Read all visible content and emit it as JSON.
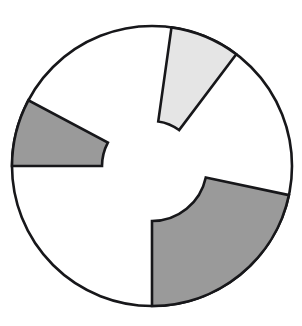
{
  "figure": {
    "title": "",
    "background_color": "#ffffff",
    "outline_color": "#17171a",
    "outline_width": 2.6
  },
  "chart_data": {
    "type": "pie",
    "title": "",
    "subtitle": "",
    "xlabel": "",
    "ylabel": "",
    "grid": false,
    "legend_position": "none",
    "center": {
      "x": 152,
      "y": 166
    },
    "radius": 140,
    "note": "Exploded/annular pie: highlighted wedges are drawn as annular segments that do not reach the centre; remaining area is an unbroken white disc.",
    "categories": [
      "Segment A",
      "Segment B",
      "Segment C",
      "Remainder"
    ],
    "values": [
      8,
      8,
      22,
      62
    ],
    "colors": [
      "#e5e5e5",
      "#9a9a9a",
      "#9a9a9a",
      "#ffffff"
    ],
    "slices": [
      {
        "name": "Segment A",
        "label": "light-gray-wedge",
        "fill": "#e5e5e5",
        "start_angle_deg": 53,
        "end_angle_deg": 82,
        "sweep_deg": 29,
        "percent": 8,
        "inner_radius": 45,
        "outer_radius": 140
      },
      {
        "name": "Segment B",
        "label": "upper-left-dark-wedge",
        "fill": "#9a9a9a",
        "start_angle_deg": 152,
        "end_angle_deg": 180,
        "sweep_deg": 28,
        "percent": 8,
        "inner_radius": 50,
        "outer_radius": 140
      },
      {
        "name": "Segment C",
        "label": "lower-right-dark-wedge",
        "fill": "#9a9a9a",
        "start_angle_deg": 270,
        "end_angle_deg": 348,
        "sweep_deg": 78,
        "percent": 22,
        "inner_radius": 55,
        "outer_radius": 140
      },
      {
        "name": "Remainder",
        "label": "white-remainder",
        "fill": "#ffffff",
        "start_angle_deg": 0,
        "end_angle_deg": 360,
        "sweep_deg": 225,
        "percent": 62,
        "inner_radius": 0,
        "outer_radius": 140
      }
    ]
  }
}
